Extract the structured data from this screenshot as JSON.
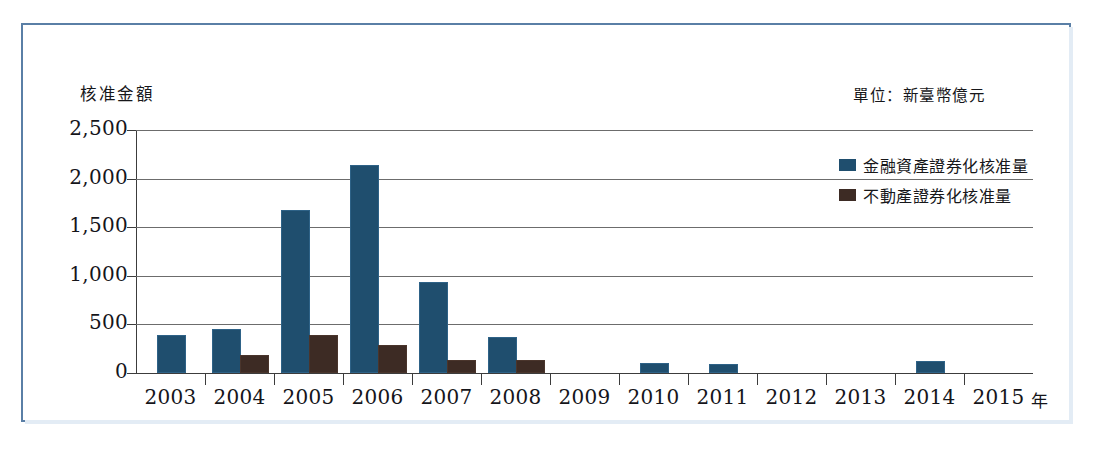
{
  "chart_data": {
    "type": "bar",
    "title": "核准金額",
    "subtitle": "單位：新臺幣億元",
    "xlabel": "年",
    "ylabel": "核准金額",
    "grid": true,
    "legend_position": "top-right",
    "ylim": [
      0,
      2500
    ],
    "ytick_labels": [
      "2,500",
      "2,000",
      "1,500",
      "1,000",
      "500",
      "0"
    ],
    "ytick_values": [
      2500,
      2000,
      1500,
      1000,
      500,
      0
    ],
    "categories": [
      "2003",
      "2004",
      "2005",
      "2006",
      "2007",
      "2008",
      "2009",
      "2010",
      "2011",
      "2012",
      "2013",
      "2014",
      "2015"
    ],
    "series": [
      {
        "name": "金融資產證券化核准量",
        "color": "#1f4e6e",
        "values": [
          375,
          430,
          1660,
          2120,
          920,
          345,
          0,
          85,
          75,
          0,
          0,
          105,
          0
        ]
      },
      {
        "name": "不動產證券化核准量",
        "color": "#3d2b24",
        "values": [
          0,
          165,
          375,
          265,
          110,
          115,
          0,
          0,
          0,
          0,
          0,
          0,
          0
        ]
      }
    ]
  },
  "legend": {
    "items": [
      {
        "label": "金融資產證券化核准量",
        "swatch": "financial"
      },
      {
        "label": "不動產證券化核准量",
        "swatch": "realestate"
      }
    ]
  },
  "axis": {
    "y_title": "核准金額",
    "x_unit": "年",
    "unit_note": "單位：新臺幣億元"
  }
}
